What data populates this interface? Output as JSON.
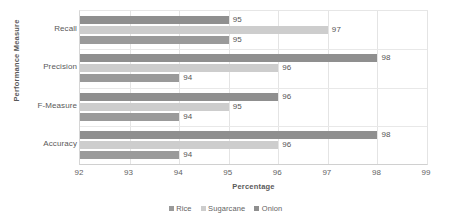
{
  "chart_data": {
    "type": "bar",
    "orientation": "horizontal",
    "title": "",
    "xlabel": "Percentage",
    "ylabel": "Performance Measure",
    "xlim": [
      92,
      99
    ],
    "xticks": [
      92,
      93,
      94,
      95,
      96,
      97,
      98,
      99
    ],
    "grid": true,
    "legend_position": "bottom",
    "categories": [
      "Recall",
      "Precision",
      "F-Measure",
      "Accuracy"
    ],
    "series": [
      {
        "name": "Rice",
        "color": "#9a9a9a",
        "values": [
          95,
          94,
          94,
          94
        ]
      },
      {
        "name": "Sugarcane",
        "color": "#cdcdcd",
        "values": [
          97,
          96,
          95,
          96
        ]
      },
      {
        "name": "Onion",
        "color": "#8f8f8f",
        "values": [
          95,
          98,
          96,
          98
        ]
      }
    ],
    "bar_order_within_group_top_to_bottom": [
      "Onion",
      "Sugarcane",
      "Rice"
    ],
    "data_labels": {
      "Recall": {
        "Onion": "95",
        "Sugarcane": "97",
        "Rice": "95"
      },
      "Precision": {
        "Onion": "98",
        "Sugarcane": "96",
        "Rice": "94"
      },
      "F-Measure": {
        "Onion": "96",
        "Sugarcane": "95",
        "Rice": "94"
      },
      "Accuracy": {
        "Onion": "98",
        "Sugarcane": "96",
        "Rice": "94"
      }
    }
  },
  "axes": {
    "y_title": "Performance Measure",
    "x_title": "Percentage",
    "y_tick_labels": [
      "Recall",
      "Precision",
      "F-Measure",
      "Accuracy"
    ],
    "x_tick_labels": [
      "92",
      "93",
      "94",
      "95",
      "96",
      "97",
      "98",
      "99"
    ]
  },
  "legend": {
    "items": [
      {
        "label": "Rice",
        "color": "#9a9a9a"
      },
      {
        "label": "Sugarcane",
        "color": "#cdcdcd"
      },
      {
        "label": "Onion",
        "color": "#8f8f8f"
      }
    ]
  }
}
